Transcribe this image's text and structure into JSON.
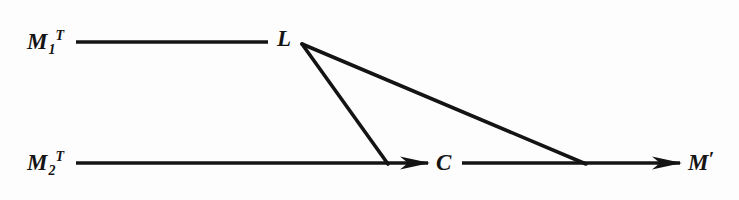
{
  "figure": {
    "background_color": "#fdfdfd",
    "ink_color": "#141414",
    "line_width": 3.2,
    "nodes": [
      {
        "id": "m1t",
        "base": "M",
        "subscript": "1",
        "superscript": "T",
        "prime": "",
        "x": 27,
        "y": 30
      },
      {
        "id": "m2t",
        "base": "M",
        "subscript": "2",
        "superscript": "T",
        "prime": "",
        "x": 27,
        "y": 151
      },
      {
        "id": "l",
        "base": "L",
        "subscript": "",
        "superscript": "",
        "prime": "",
        "x": 277,
        "y": 27
      },
      {
        "id": "c",
        "base": "C",
        "subscript": "",
        "superscript": "",
        "prime": "",
        "x": 436,
        "y": 151
      },
      {
        "id": "mprime",
        "base": "M",
        "subscript": "",
        "superscript": "",
        "prime": "′",
        "x": 688,
        "y": 151
      }
    ],
    "edges": [
      {
        "id": "edge-m1t-to-l",
        "from": "m1t",
        "to": "l",
        "x1": 76,
        "y1": 42,
        "x2": 268,
        "y2": 42,
        "arrow": false
      },
      {
        "id": "edge-m2t-to-c",
        "from": "m2t",
        "to": "c",
        "x1": 76,
        "y1": 163,
        "x2": 428,
        "y2": 163,
        "arrow": true
      },
      {
        "id": "edge-c-to-mprime",
        "from": "c",
        "to": "mprime",
        "x1": 462,
        "y1": 163,
        "x2": 681,
        "y2": 163,
        "arrow": true
      },
      {
        "id": "edge-l-to-c-branch",
        "from": "l",
        "to": "c",
        "x1": 302,
        "y1": 44,
        "x2": 388,
        "y2": 163,
        "arrow": false
      },
      {
        "id": "edge-l-to-mprime-branch",
        "from": "l",
        "to": "mprime",
        "x1": 302,
        "y1": 44,
        "x2": 585,
        "y2": 163,
        "arrow": false
      }
    ],
    "arrowheads": [
      {
        "id": "arrowhead-to-c",
        "tip_x": 430,
        "tip_y": 163,
        "length": 30,
        "half_width": 7
      },
      {
        "id": "arrowhead-to-mprime",
        "tip_x": 682,
        "tip_y": 163,
        "length": 30,
        "half_width": 7
      }
    ]
  }
}
